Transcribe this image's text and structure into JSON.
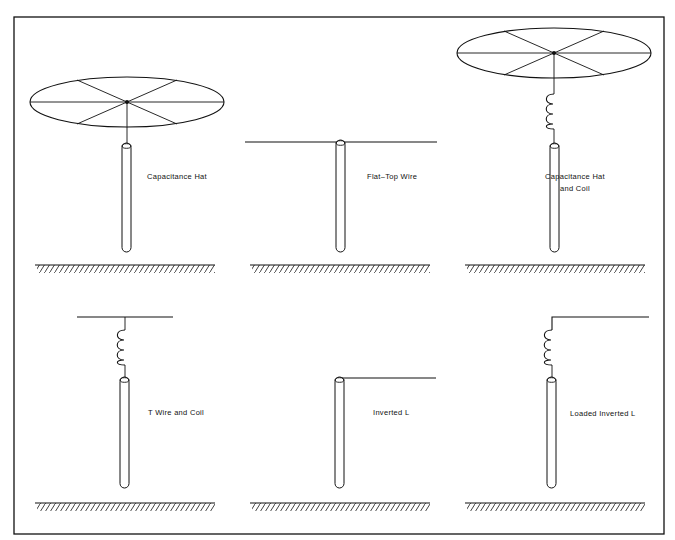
{
  "figure": {
    "title": "",
    "frame": {
      "x": 14,
      "y": 17,
      "width": 650,
      "height": 517
    },
    "panels": [
      {
        "id": "capacitance-hat",
        "label_lines": [
          "Capacitance Hat"
        ],
        "top_loading": "capacitance-hat",
        "coil": false
      },
      {
        "id": "flat-top-wire",
        "label_lines": [
          "Flat–Top Wire"
        ],
        "top_loading": "flat-top-wire",
        "coil": false
      },
      {
        "id": "capacitance-hat-and-coil",
        "label_lines": [
          "Capacitance Hat",
          "and Coil"
        ],
        "top_loading": "capacitance-hat",
        "coil": true
      },
      {
        "id": "t-wire-and-coil",
        "label_lines": [
          "T Wire and Coil"
        ],
        "top_loading": "t-wire",
        "coil": true
      },
      {
        "id": "inverted-l",
        "label_lines": [
          "Inverted L"
        ],
        "top_loading": "horizontal-wire-right",
        "coil": false
      },
      {
        "id": "loaded-inverted-l",
        "label_lines": [
          "Loaded Inverted L"
        ],
        "top_loading": "horizontal-wire-right",
        "coil": true
      }
    ],
    "colors": {
      "line": "#111111",
      "background": "#ffffff"
    }
  }
}
